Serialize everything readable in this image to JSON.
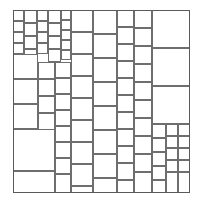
{
  "figure": {
    "type": "geometric-dissection",
    "background_color": "#ffffff",
    "line_color": "#6e6e6e",
    "frame_color": "#5a5a5a",
    "line_width_px": 1,
    "canvas": {
      "width": 203,
      "height": 203
    },
    "outer_square": {
      "x": 13,
      "y": 10,
      "width": 177,
      "height": 183
    },
    "tile_count": 78,
    "tiles": [
      {
        "name": "tile-01",
        "x": 13,
        "y": 10,
        "w": 11,
        "h": 11
      },
      {
        "name": "tile-02",
        "x": 24,
        "y": 10,
        "w": 13,
        "h": 13
      },
      {
        "name": "tile-03",
        "x": 37,
        "y": 10,
        "w": 11,
        "h": 11
      },
      {
        "name": "tile-04",
        "x": 48,
        "y": 10,
        "w": 13,
        "h": 13
      },
      {
        "name": "tile-05",
        "x": 61,
        "y": 10,
        "w": 10,
        "h": 10
      },
      {
        "name": "tile-06",
        "x": 71,
        "y": 10,
        "w": 22,
        "h": 22
      },
      {
        "name": "tile-07",
        "x": 93,
        "y": 10,
        "w": 24,
        "h": 24
      },
      {
        "name": "tile-08",
        "x": 117,
        "y": 10,
        "w": 17,
        "h": 17
      },
      {
        "name": "tile-09",
        "x": 134,
        "y": 10,
        "w": 18,
        "h": 18
      },
      {
        "name": "tile-10",
        "x": 152,
        "y": 10,
        "w": 38,
        "h": 38
      },
      {
        "name": "tile-11",
        "x": 13,
        "y": 21,
        "w": 11,
        "h": 11
      },
      {
        "name": "tile-12",
        "x": 37,
        "y": 21,
        "w": 11,
        "h": 11
      },
      {
        "name": "tile-13",
        "x": 61,
        "y": 20,
        "w": 10,
        "h": 10
      },
      {
        "name": "tile-14",
        "x": 24,
        "y": 23,
        "w": 13,
        "h": 13
      },
      {
        "name": "tile-15",
        "x": 48,
        "y": 23,
        "w": 13,
        "h": 13
      },
      {
        "name": "tile-16",
        "x": 117,
        "y": 27,
        "w": 17,
        "h": 17
      },
      {
        "name": "tile-17",
        "x": 134,
        "y": 28,
        "w": 18,
        "h": 18
      },
      {
        "name": "tile-18",
        "x": 13,
        "y": 32,
        "w": 11,
        "h": 11
      },
      {
        "name": "tile-19",
        "x": 37,
        "y": 32,
        "w": 11,
        "h": 11
      },
      {
        "name": "tile-20",
        "x": 61,
        "y": 30,
        "w": 10,
        "h": 10
      },
      {
        "name": "tile-21",
        "x": 71,
        "y": 32,
        "w": 22,
        "h": 22
      },
      {
        "name": "tile-22",
        "x": 93,
        "y": 34,
        "w": 24,
        "h": 24
      },
      {
        "name": "tile-23",
        "x": 24,
        "y": 36,
        "w": 13,
        "h": 13
      },
      {
        "name": "tile-24",
        "x": 48,
        "y": 36,
        "w": 13,
        "h": 13
      },
      {
        "name": "tile-25",
        "x": 61,
        "y": 40,
        "w": 10,
        "h": 10
      },
      {
        "name": "tile-26",
        "x": 13,
        "y": 43,
        "w": 11,
        "h": 11
      },
      {
        "name": "tile-27",
        "x": 37,
        "y": 43,
        "w": 11,
        "h": 11
      },
      {
        "name": "tile-28",
        "x": 117,
        "y": 44,
        "w": 17,
        "h": 17
      },
      {
        "name": "tile-29",
        "x": 134,
        "y": 46,
        "w": 18,
        "h": 18
      },
      {
        "name": "tile-30",
        "x": 152,
        "y": 48,
        "w": 38,
        "h": 38
      },
      {
        "name": "tile-31",
        "x": 24,
        "y": 49,
        "w": 13,
        "h": 13
      },
      {
        "name": "tile-32",
        "x": 48,
        "y": 49,
        "w": 13,
        "h": 13
      },
      {
        "name": "tile-33",
        "x": 61,
        "y": 50,
        "w": 10,
        "h": 10
      },
      {
        "name": "tile-34",
        "x": 71,
        "y": 54,
        "w": 22,
        "h": 22
      },
      {
        "name": "tile-35",
        "x": 93,
        "y": 58,
        "w": 24,
        "h": 24
      },
      {
        "name": "tile-36",
        "x": 13,
        "y": 54,
        "w": 25,
        "h": 25
      },
      {
        "name": "tile-37",
        "x": 38,
        "y": 62,
        "w": 17,
        "h": 17
      },
      {
        "name": "tile-38",
        "x": 55,
        "y": 62,
        "w": 16,
        "h": 16
      },
      {
        "name": "tile-39",
        "x": 117,
        "y": 61,
        "w": 17,
        "h": 17
      },
      {
        "name": "tile-40",
        "x": 134,
        "y": 64,
        "w": 18,
        "h": 18
      },
      {
        "name": "tile-41",
        "x": 13,
        "y": 79,
        "w": 25,
        "h": 25
      },
      {
        "name": "tile-42",
        "x": 38,
        "y": 79,
        "w": 17,
        "h": 17
      },
      {
        "name": "tile-43",
        "x": 55,
        "y": 78,
        "w": 16,
        "h": 16
      },
      {
        "name": "tile-44",
        "x": 71,
        "y": 76,
        "w": 22,
        "h": 22
      },
      {
        "name": "tile-45",
        "x": 93,
        "y": 82,
        "w": 24,
        "h": 24
      },
      {
        "name": "tile-46",
        "x": 117,
        "y": 78,
        "w": 17,
        "h": 17
      },
      {
        "name": "tile-47",
        "x": 134,
        "y": 82,
        "w": 18,
        "h": 18
      },
      {
        "name": "tile-48",
        "x": 152,
        "y": 86,
        "w": 38,
        "h": 38
      },
      {
        "name": "tile-49",
        "x": 38,
        "y": 96,
        "w": 17,
        "h": 17
      },
      {
        "name": "tile-50",
        "x": 55,
        "y": 94,
        "w": 16,
        "h": 16
      },
      {
        "name": "tile-51",
        "x": 71,
        "y": 98,
        "w": 22,
        "h": 22
      },
      {
        "name": "tile-52",
        "x": 117,
        "y": 95,
        "w": 17,
        "h": 17
      },
      {
        "name": "tile-53",
        "x": 134,
        "y": 100,
        "w": 18,
        "h": 18
      },
      {
        "name": "tile-54",
        "x": 13,
        "y": 104,
        "w": 25,
        "h": 25
      },
      {
        "name": "tile-55",
        "x": 38,
        "y": 113,
        "w": 17,
        "h": 17
      },
      {
        "name": "tile-56",
        "x": 55,
        "y": 110,
        "w": 16,
        "h": 16
      },
      {
        "name": "tile-57",
        "x": 93,
        "y": 106,
        "w": 24,
        "h": 24
      },
      {
        "name": "tile-58",
        "x": 117,
        "y": 112,
        "w": 17,
        "h": 17
      },
      {
        "name": "tile-59",
        "x": 134,
        "y": 118,
        "w": 18,
        "h": 18
      },
      {
        "name": "tile-60",
        "x": 71,
        "y": 120,
        "w": 22,
        "h": 22
      },
      {
        "name": "tile-61",
        "x": 55,
        "y": 126,
        "w": 16,
        "h": 16
      },
      {
        "name": "tile-62",
        "x": 152,
        "y": 124,
        "w": 14,
        "h": 14
      },
      {
        "name": "tile-63",
        "x": 166,
        "y": 124,
        "w": 12,
        "h": 12
      },
      {
        "name": "tile-64",
        "x": 178,
        "y": 124,
        "w": 12,
        "h": 12
      },
      {
        "name": "tile-65",
        "x": 13,
        "y": 129,
        "w": 42,
        "h": 42
      },
      {
        "name": "tile-66",
        "x": 93,
        "y": 130,
        "w": 24,
        "h": 24
      },
      {
        "name": "tile-67",
        "x": 117,
        "y": 129,
        "w": 17,
        "h": 17
      },
      {
        "name": "tile-68",
        "x": 134,
        "y": 136,
        "w": 18,
        "h": 18
      },
      {
        "name": "tile-69",
        "x": 152,
        "y": 138,
        "w": 14,
        "h": 14
      },
      {
        "name": "tile-70",
        "x": 166,
        "y": 136,
        "w": 12,
        "h": 12
      },
      {
        "name": "tile-71",
        "x": 178,
        "y": 136,
        "w": 12,
        "h": 12
      },
      {
        "name": "tile-72",
        "x": 55,
        "y": 142,
        "w": 16,
        "h": 16
      },
      {
        "name": "tile-73",
        "x": 71,
        "y": 142,
        "w": 22,
        "h": 22
      },
      {
        "name": "tile-74",
        "x": 117,
        "y": 146,
        "w": 17,
        "h": 17
      },
      {
        "name": "tile-75",
        "x": 134,
        "y": 154,
        "w": 18,
        "h": 18
      },
      {
        "name": "tile-76",
        "x": 152,
        "y": 152,
        "w": 14,
        "h": 14
      },
      {
        "name": "tile-77",
        "x": 166,
        "y": 148,
        "w": 12,
        "h": 12
      },
      {
        "name": "tile-78",
        "x": 178,
        "y": 148,
        "w": 12,
        "h": 12
      },
      {
        "name": "tile-79",
        "x": 55,
        "y": 158,
        "w": 16,
        "h": 16
      },
      {
        "name": "tile-80",
        "x": 71,
        "y": 164,
        "w": 22,
        "h": 22
      },
      {
        "name": "tile-81",
        "x": 93,
        "y": 154,
        "w": 24,
        "h": 24
      },
      {
        "name": "tile-82",
        "x": 117,
        "y": 163,
        "w": 17,
        "h": 17
      },
      {
        "name": "tile-83",
        "x": 152,
        "y": 166,
        "w": 14,
        "h": 14
      },
      {
        "name": "tile-84",
        "x": 166,
        "y": 160,
        "w": 12,
        "h": 12
      },
      {
        "name": "tile-85",
        "x": 178,
        "y": 160,
        "w": 12,
        "h": 12
      },
      {
        "name": "tile-86",
        "x": 13,
        "y": 171,
        "w": 42,
        "h": 22
      },
      {
        "name": "tile-87",
        "x": 55,
        "y": 174,
        "w": 16,
        "h": 19
      },
      {
        "name": "tile-88",
        "x": 71,
        "y": 186,
        "w": 22,
        "h": 7
      },
      {
        "name": "tile-89",
        "x": 93,
        "y": 178,
        "w": 24,
        "h": 15
      },
      {
        "name": "tile-90",
        "x": 117,
        "y": 180,
        "w": 17,
        "h": 13
      },
      {
        "name": "tile-91",
        "x": 134,
        "y": 172,
        "w": 18,
        "h": 21
      },
      {
        "name": "tile-92",
        "x": 152,
        "y": 180,
        "w": 14,
        "h": 13
      },
      {
        "name": "tile-93",
        "x": 166,
        "y": 172,
        "w": 12,
        "h": 21
      },
      {
        "name": "tile-94",
        "x": 178,
        "y": 172,
        "w": 12,
        "h": 21
      }
    ]
  }
}
